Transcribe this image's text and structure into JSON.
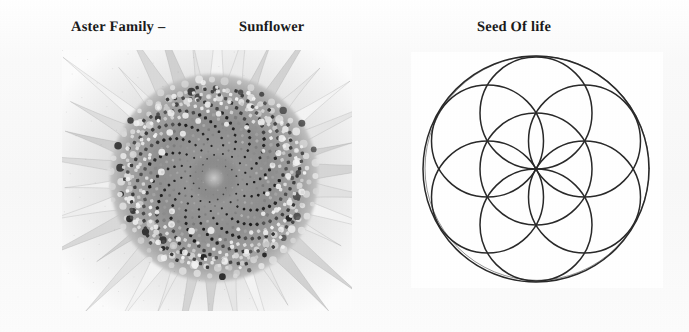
{
  "page": {
    "background_color": "#fbfbfb",
    "text_color": "#1b1b1b"
  },
  "captions": {
    "aster_family": "Aster Family –",
    "sunflower": "Sunflower",
    "seed_of_life": "Seed Of life"
  },
  "figures": {
    "sunflower": {
      "name": "sunflower-photograph",
      "alt": "Grayscale close-up photograph of a sunflower head showing Fibonacci spiral seed packing",
      "type": "photograph",
      "palette": "grayscale",
      "disc_center_x": 152,
      "disc_center_y": 128,
      "seed_count": 620,
      "spiral_divergence_degrees": 137.507764,
      "petal_count": 34,
      "petal_color": "#e9e9e9",
      "seed_dark_color": "#1d1d1d",
      "seed_light_color": "#f2f2f2"
    },
    "seed_of_life": {
      "name": "seed-of-life-diagram",
      "alt": "Seed of Life sacred geometry figure: one central circle with six overlapping circles, all enclosed by a larger circle",
      "type": "line-diagram",
      "background_color": "#ffffff",
      "stroke_color": "#2a2a2a",
      "stroke_width": 1.5,
      "center_x": 125,
      "center_y": 117,
      "petal_radius": 56,
      "enclosing_radius": 113,
      "inner_circle_count": 7,
      "outer_circle_count": 1,
      "ring_angles_degrees": [
        0,
        60,
        120,
        180,
        240,
        300
      ]
    }
  }
}
